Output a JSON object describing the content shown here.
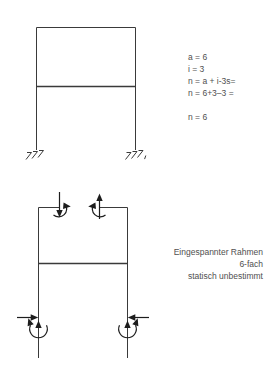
{
  "colors": {
    "background": "#ffffff",
    "line": "#3a3a3a",
    "arrow": "#1d1d1d",
    "text": "#4f4f4f"
  },
  "top_figure": {
    "formulas": [
      "a = 6",
      "i = 3",
      "n = a + i-3s=",
      "n = 6+3–3 =",
      "n = 6"
    ]
  },
  "bottom_figure": {
    "caption": [
      "Eingespannter Rahmen",
      "6-fach",
      "statisch unbestimmt"
    ]
  }
}
